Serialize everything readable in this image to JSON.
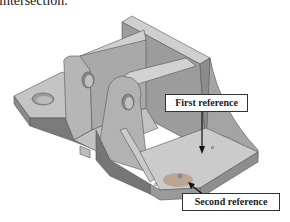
{
  "caption": {
    "partial_text": "intersection."
  },
  "figure": {
    "colors": {
      "face_light": "#c9c9c9",
      "face_mid": "#a8a8a8",
      "face_dark": "#7e7e7e",
      "edge": "#555555",
      "highlight_ref": "#b8a08a"
    }
  },
  "callouts": {
    "first_reference": "First reference",
    "second_reference": "Second reference"
  },
  "markers": {
    "first_marker": "o",
    "second_marker": "o"
  }
}
